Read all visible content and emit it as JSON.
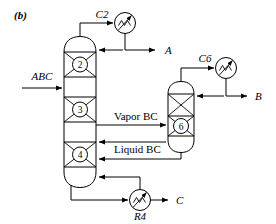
{
  "figure": {
    "panel_label": "(b)",
    "type": "process-flow-diagram"
  },
  "streams": {
    "feed": {
      "label": "ABC",
      "direction": "into column left side"
    },
    "top_product": {
      "label": "A",
      "direction": "out to the right from column top"
    },
    "side_product": {
      "label": "B",
      "direction": "out to the right from side vessel top"
    },
    "bottom_product": {
      "label": "C",
      "direction": "out to the right from reboiler"
    },
    "vapor_link": {
      "label": "Vapor BC",
      "direction": "from column to side vessel"
    },
    "liquid_link": {
      "label": "Liquid BC",
      "direction": "from side vessel back to column"
    }
  },
  "equipment": {
    "condenser_main": {
      "tag": "C2",
      "kind": "condenser",
      "icon": "heat-exchanger-icon"
    },
    "condenser_side": {
      "tag": "C6",
      "kind": "condenser",
      "icon": "heat-exchanger-icon"
    },
    "reboiler": {
      "tag": "R4",
      "kind": "reboiler",
      "icon": "heat-exchanger-icon"
    },
    "main_column": {
      "kind": "distillation-column",
      "trays": [
        "2",
        "3",
        "4"
      ]
    },
    "side_column": {
      "kind": "side-stripper-vessel",
      "trays": [
        "6"
      ]
    }
  },
  "colors": {
    "line": "#000000",
    "background": "#ffffff",
    "vessel_fill": "#ffffff"
  }
}
